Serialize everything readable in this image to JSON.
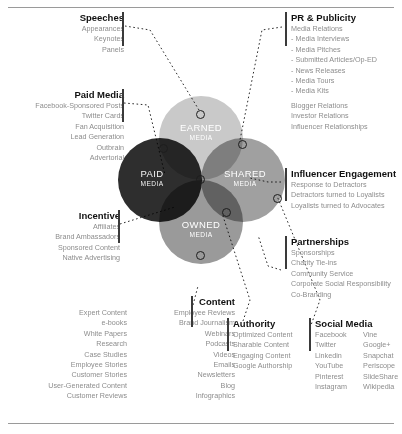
{
  "diagram": {
    "circles": [
      {
        "key": "earned",
        "label": "EARNED",
        "sublabel": "MEDIA",
        "color": "#c9c9c9"
      },
      {
        "key": "shared",
        "label": "SHARED",
        "sublabel": "MEDIA",
        "color": "#a0a0a0"
      },
      {
        "key": "owned",
        "label": "OWNED",
        "sublabel": "MEDIA",
        "color": "#9a9a9a"
      },
      {
        "key": "paid",
        "label": "PAID",
        "sublabel": "MEDIA",
        "color": "#2e2e2e"
      }
    ]
  },
  "sections": {
    "speeches": {
      "title": "Speeches",
      "items": [
        "Appearances",
        "Keynotes",
        "Panels"
      ]
    },
    "paid_media": {
      "title": "Paid Media",
      "items": [
        "Facebook-Sponsored Posts",
        "Twitter Cards",
        "Fan Acquisition",
        "Lead Generation",
        "Outbrain",
        "Advertorial"
      ]
    },
    "incentive": {
      "title": "Incentive",
      "items": [
        "Affiliates",
        "Brand Ambassadors",
        "Sponsored Content",
        "Native Advertising"
      ]
    },
    "content": {
      "title": "Content",
      "col1": [
        "Expert Content",
        "e-books",
        "White Papers",
        "Research",
        "Case Studies",
        "Employee Stories",
        "Customer Stories",
        "User-Generated Content",
        "Customer Reviews"
      ],
      "col2": [
        "Employee Reviews",
        "Brand Journalism",
        "Webinars",
        "Podcasts",
        "Videos",
        "Emails",
        "Newsletters",
        "Blog",
        "Infographics"
      ]
    },
    "authority": {
      "title": "Authority",
      "items": [
        "Optimized Content",
        "Sharable Content",
        "Engaging Content",
        "Google Authorship"
      ]
    },
    "social_media": {
      "title": "Social Media",
      "col1": [
        "Facebook",
        "Twitter",
        "Linkedin",
        "YouTube",
        "Pinterest",
        "Instagram"
      ],
      "col2": [
        "Vine",
        "Google+",
        "Snapchat",
        "Periscope",
        "SlideShare",
        "Wikipedia"
      ]
    },
    "pr_publicity": {
      "title": "PR & Publicity",
      "items": [
        "Media Relations",
        "- Media Interviews",
        "- Media Pitches",
        "- Submitted Articles/Op-ED",
        "- News Releases",
        "- Media Tours",
        "- Media Kits",
        "Blogger Relations",
        "Investor Relations",
        "Influencer Relationships"
      ]
    },
    "influencer_engagement": {
      "title": "Influencer Engagement",
      "items": [
        "Response to Detractors",
        "Detractors turned to Loyalists",
        "Loyalists turned to Advocates"
      ]
    },
    "partnerships": {
      "title": "Partnerships",
      "items": [
        "Sponsorships",
        "Charity Tie-ins",
        "Community Service",
        "Corporate Social Responsibility",
        "Co-Branding"
      ]
    }
  }
}
